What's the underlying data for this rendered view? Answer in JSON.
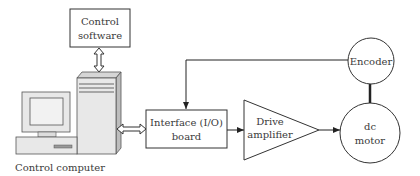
{
  "diagram": {
    "nodes": {
      "control_software": {
        "line1": "Control",
        "line2": "software"
      },
      "control_computer": {
        "label": "Control computer"
      },
      "interface_board": {
        "line1": "Interface (I/O)",
        "line2": "board"
      },
      "drive_amplifier": {
        "line1": "Drive",
        "line2": "amplifier"
      },
      "dc_motor": {
        "line1": "dc",
        "line2": "motor"
      },
      "encoder": {
        "label": "Encoder"
      }
    },
    "edges": [
      {
        "from": "control_software",
        "to": "control_computer",
        "type": "bidirectional"
      },
      {
        "from": "control_computer",
        "to": "interface_board",
        "type": "bidirectional"
      },
      {
        "from": "interface_board",
        "to": "drive_amplifier",
        "type": "arrow"
      },
      {
        "from": "drive_amplifier",
        "to": "dc_motor",
        "type": "arrow"
      },
      {
        "from": "dc_motor",
        "to": "encoder",
        "type": "shaft"
      },
      {
        "from": "encoder",
        "to": "interface_board",
        "type": "feedback-arrow"
      }
    ],
    "colors": {
      "stroke": "#333333",
      "computer_fill": "#e8e8e8",
      "computer_dark": "#bdbdbd"
    }
  }
}
